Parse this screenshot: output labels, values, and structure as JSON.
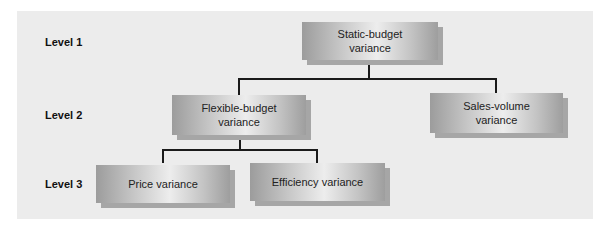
{
  "diagram": {
    "levels": [
      {
        "label": "Level 1"
      },
      {
        "label": "Level 2"
      },
      {
        "label": "Level 3"
      }
    ],
    "nodes": {
      "static_budget": {
        "line1": "Static-budget",
        "line2": "variance"
      },
      "flexible_budget": {
        "line1": "Flexible-budget",
        "line2": "variance"
      },
      "sales_volume": {
        "line1": "Sales-volume",
        "line2": "variance"
      },
      "price": {
        "line1": "Price variance"
      },
      "efficiency": {
        "line1": "Efficiency variance"
      }
    },
    "edges": [
      [
        "static_budget",
        "flexible_budget"
      ],
      [
        "static_budget",
        "sales_volume"
      ],
      [
        "flexible_budget",
        "price"
      ],
      [
        "flexible_budget",
        "efficiency"
      ]
    ]
  }
}
